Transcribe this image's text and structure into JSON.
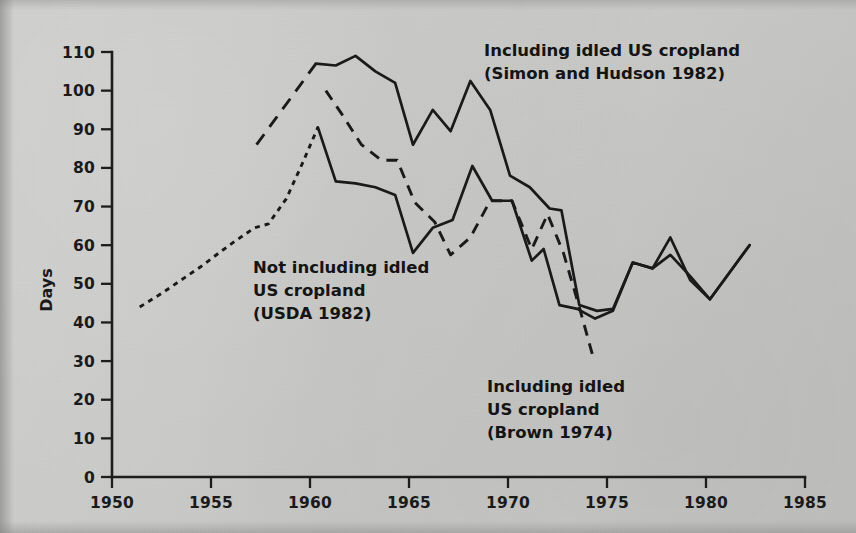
{
  "figure": {
    "background_color": "#c9c9c7",
    "ink_color": "#1a1a1a"
  },
  "axes": {
    "y_title": "Days",
    "y_ticks": [
      "0",
      "10",
      "20",
      "30",
      "40",
      "50",
      "60",
      "70",
      "80",
      "90",
      "100",
      "110"
    ],
    "x_ticks": [
      "1950",
      "1955",
      "1960",
      "1965",
      "1970",
      "1975",
      "1980",
      "1985"
    ]
  },
  "annotations": [
    {
      "id": "simon-hudson",
      "line1": "Including idled US cropland",
      "line2": "(Simon and Hudson 1982)"
    },
    {
      "id": "usda",
      "line1": "Not including idled",
      "line2": "US cropland",
      "line3": "(USDA 1982)"
    },
    {
      "id": "brown",
      "line1": "Including idled",
      "line2": "US cropland",
      "line3": "(Brown 1974)"
    }
  ],
  "chart_data": {
    "type": "line",
    "title": "",
    "xlabel": "",
    "ylabel": "Days",
    "xlim": [
      1950,
      1985
    ],
    "ylim": [
      0,
      110
    ],
    "grid": false,
    "legend_position": "inline-annotations",
    "x_tick_values": [
      1950,
      1955,
      1960,
      1965,
      1970,
      1975,
      1980,
      1985
    ],
    "y_tick_values": [
      0,
      10,
      20,
      30,
      40,
      50,
      60,
      70,
      80,
      90,
      100,
      110
    ],
    "series": [
      {
        "name": "Not including idled US cropland (USDA 1982) - early dotted segment",
        "style": "dotted",
        "x": [
          1951.4,
          1952.5,
          1953.5,
          1954.5,
          1955.4,
          1956.2,
          1957.2,
          1957.9,
          1958.8,
          1959.6,
          1960.4
        ],
        "values": [
          44,
          47.5,
          51,
          54.5,
          58,
          61,
          64.5,
          65.5,
          72,
          81,
          90.5
        ]
      },
      {
        "name": "Not including idled US cropland (USDA 1982) - solid segment",
        "style": "solid",
        "x": [
          1960.4,
          1961.3,
          1962.3,
          1963.3,
          1964.3,
          1965.2,
          1966.2,
          1967.2,
          1968.2,
          1969.2,
          1970.2,
          1971.2,
          1971.8,
          1972.6,
          1973.5,
          1974.4,
          1975.3,
          1976.3,
          1977.3,
          1978.2,
          1979.2,
          1980.2,
          1981.2,
          1982.2
        ],
        "values": [
          90.5,
          76.5,
          76,
          75,
          73,
          58,
          64.5,
          66.5,
          80.5,
          71.5,
          71.5,
          56,
          59,
          44.5,
          43.5,
          41,
          43,
          55.5,
          54,
          57.5,
          52,
          46,
          53,
          60
        ]
      },
      {
        "name": "Including idled US cropland (Simon and Hudson 1982) - dashed lead-in",
        "style": "dashed-long",
        "x": [
          1957.3,
          1958.3,
          1959.3,
          1960.3
        ],
        "values": [
          86,
          93,
          100,
          107
        ]
      },
      {
        "name": "Including idled US cropland (Simon and Hudson 1982) - solid",
        "style": "solid",
        "x": [
          1960.3,
          1961.3,
          1962.3,
          1963.3,
          1964.3,
          1965.2,
          1966.2,
          1967.1,
          1968.1,
          1969.1,
          1970.1,
          1971.1,
          1972.1,
          1972.7,
          1973.6,
          1974.5,
          1975.3,
          1976.3,
          1977.3,
          1978.2,
          1979.2,
          1980.2,
          1981.2,
          1982.2
        ],
        "values": [
          107,
          106.5,
          109,
          105,
          102,
          86,
          95,
          89.5,
          102.5,
          95,
          78,
          75,
          69.5,
          69,
          44.5,
          43,
          43.5,
          55.5,
          54,
          62,
          51,
          46,
          53,
          60
        ]
      },
      {
        "name": "Including idled US cropland (Brown 1974)",
        "style": "dashed-medium",
        "x": [
          1960.8,
          1961.6,
          1962.6,
          1963.6,
          1964.4,
          1965.3,
          1966.3,
          1967.1,
          1968.1,
          1969.1,
          1970.2,
          1971.2,
          1972.0,
          1972.8,
          1973.6,
          1974.3
        ],
        "values": [
          100,
          94,
          86,
          82,
          82,
          71,
          66,
          57.5,
          62,
          71.5,
          71.5,
          59,
          68,
          58,
          44,
          31
        ]
      }
    ]
  }
}
